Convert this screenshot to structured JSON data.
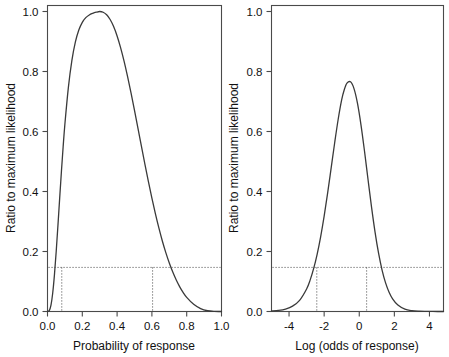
{
  "figure": {
    "background": "#ffffff",
    "curve_color": "#3a3a3a",
    "frame_color": "#4a4a4a",
    "refline_color": "#555555"
  },
  "chart_data": [
    {
      "type": "line",
      "panel": "left",
      "title": "",
      "xlabel": "Probability of response",
      "ylabel": "Ratio to maximum likelihood",
      "xlim": [
        0.0,
        1.0
      ],
      "ylim": [
        0.0,
        1.02
      ],
      "xticks": [
        0.0,
        0.2,
        0.4,
        0.6,
        0.8,
        1.0
      ],
      "xticklabels": [
        "0.0",
        "0.2",
        "0.4",
        "0.6",
        "0.8",
        "1.0"
      ],
      "yticks": [
        0.0,
        0.2,
        0.4,
        0.6,
        0.8,
        1.0
      ],
      "yticklabels": [
        "0.0",
        "0.2",
        "0.4",
        "0.6",
        "0.8",
        "1.0"
      ],
      "grid": false,
      "legend": "none",
      "annotations": {
        "horizontal_refline_y": 0.147,
        "vertical_reflines_x": [
          0.082,
          0.604
        ],
        "peak_x": 0.3,
        "peak_y": 1.0
      },
      "x": [
        0.0,
        0.01,
        0.02,
        0.03,
        0.04,
        0.05,
        0.06,
        0.07,
        0.08,
        0.09,
        0.1,
        0.12,
        0.14,
        0.16,
        0.18,
        0.2,
        0.22,
        0.24,
        0.26,
        0.28,
        0.3,
        0.32,
        0.34,
        0.36,
        0.38,
        0.4,
        0.42,
        0.44,
        0.46,
        0.48,
        0.5,
        0.52,
        0.54,
        0.56,
        0.58,
        0.6,
        0.62,
        0.64,
        0.66,
        0.68,
        0.7,
        0.72,
        0.74,
        0.76,
        0.78,
        0.8,
        0.84,
        0.88,
        0.92,
        0.96,
        1.0
      ],
      "y": [
        0.0,
        0.0031,
        0.0215,
        0.0617,
        0.1228,
        0.2001,
        0.2872,
        0.3779,
        0.4667,
        0.5499,
        0.6248,
        0.7472,
        0.8363,
        0.8976,
        0.9381,
        0.9638,
        0.9794,
        0.9885,
        0.9939,
        0.9976,
        1.0,
        0.9976,
        0.9891,
        0.9733,
        0.9498,
        0.9185,
        0.8798,
        0.8345,
        0.7837,
        0.7285,
        0.6703,
        0.6104,
        0.5501,
        0.4905,
        0.4327,
        0.3777,
        0.3261,
        0.2785,
        0.2351,
        0.1962,
        0.1616,
        0.1313,
        0.1049,
        0.0823,
        0.0631,
        0.047,
        0.0239,
        0.0096,
        0.0025,
        0.0002,
        0.0
      ]
    },
    {
      "type": "line",
      "panel": "right",
      "title": "",
      "xlabel": "Log (odds of response)",
      "ylabel": "Ratio to maximum likelihood",
      "xlim": [
        -5.0,
        4.8
      ],
      "ylim": [
        0.0,
        1.02
      ],
      "xticks": [
        -4,
        -2,
        0,
        2,
        4
      ],
      "xticklabels": [
        "-4",
        "-2",
        "0",
        "2",
        "4"
      ],
      "yticks": [
        0.0,
        0.2,
        0.4,
        0.6,
        0.8,
        1.0
      ],
      "yticklabels": [
        "0.0",
        "0.2",
        "0.4",
        "0.6",
        "0.8",
        "1.0"
      ],
      "grid": false,
      "legend": "none",
      "annotations": {
        "horizontal_refline_y": 0.147,
        "vertical_reflines_x": [
          -2.42,
          0.42
        ],
        "peak_x": -0.847,
        "peak_y": 1.0
      },
      "x": [
        -5.0,
        -4.6,
        -4.2,
        -3.8,
        -3.4,
        -3.0,
        -2.8,
        -2.6,
        -2.4,
        -2.2,
        -2.0,
        -1.8,
        -1.6,
        -1.4,
        -1.2,
        -1.0,
        -0.85,
        -0.7,
        -0.5,
        -0.3,
        -0.1,
        0.1,
        0.3,
        0.5,
        0.7,
        0.9,
        1.1,
        1.3,
        1.5,
        1.7,
        1.9,
        2.2,
        2.6,
        3.0,
        3.4,
        3.8,
        4.2,
        4.8
      ],
      "y": [
        0.0017,
        0.0038,
        0.0083,
        0.0178,
        0.0373,
        0.0752,
        0.1046,
        0.1427,
        0.1906,
        0.249,
        0.3177,
        0.3953,
        0.4786,
        0.5626,
        0.6408,
        0.706,
        0.74,
        0.761,
        0.7656,
        0.7429,
        0.6936,
        0.6215,
        0.5341,
        0.4401,
        0.3481,
        0.2648,
        0.1943,
        0.1382,
        0.0954,
        0.0642,
        0.0422,
        0.0213,
        0.0077,
        0.0027,
        0.0009,
        0.0003,
        0.0001,
        0.0
      ]
    }
  ],
  "panels": {
    "left": {
      "name": "probability-scale-panel",
      "xlabel": "Probability of response",
      "ylabel": "Ratio to maximum likelihood",
      "xticklabels": [
        "0.0",
        "0.2",
        "0.4",
        "0.6",
        "0.8",
        "1.0"
      ],
      "yticklabels": [
        "0.0",
        "0.2",
        "0.4",
        "0.6",
        "0.8",
        "1.0"
      ]
    },
    "right": {
      "name": "log-odds-scale-panel",
      "xlabel": "Log (odds of response)",
      "ylabel": "Ratio to maximum likelihood",
      "xticklabels": [
        "-4",
        "-2",
        "0",
        "2",
        "4"
      ],
      "yticklabels": [
        "0.0",
        "0.2",
        "0.4",
        "0.6",
        "0.8",
        "1.0"
      ]
    }
  }
}
